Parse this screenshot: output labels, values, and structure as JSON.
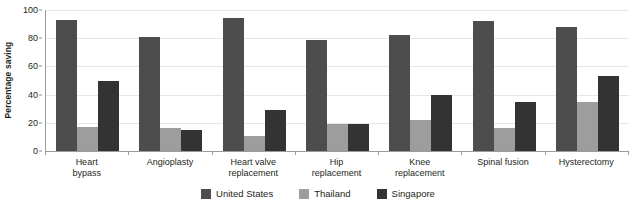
{
  "chart_data": {
    "type": "bar",
    "title": "",
    "xlabel": "",
    "ylabel": "Percentage saving",
    "ylim": [
      0,
      100
    ],
    "yticks": [
      0,
      20,
      40,
      60,
      80,
      100
    ],
    "grid": true,
    "legend_position": "bottom-center",
    "categories": [
      "Heart bypass",
      "Angioplasty",
      "Heart valve replacement",
      "Hip replacement",
      "Knee replacement",
      "Spinal fusion",
      "Hysterectomy"
    ],
    "category_lines": [
      {
        "line1": "Heart",
        "line2": "bypass"
      },
      {
        "line1": "Angioplasty",
        "line2": ""
      },
      {
        "line1": "Heart valve",
        "line2": "replacement"
      },
      {
        "line1": "Hip",
        "line2": "replacement"
      },
      {
        "line1": "Knee",
        "line2": "replacement"
      },
      {
        "line1": "Spinal fusion",
        "line2": ""
      },
      {
        "line1": "Hysterectomy",
        "line2": ""
      }
    ],
    "series": [
      {
        "name": "United States",
        "color": "#4d4d4d",
        "values": [
          93,
          81,
          94,
          79,
          82,
          92,
          88
        ]
      },
      {
        "name": "Thailand",
        "color": "#9d9d9d",
        "values": [
          17,
          16,
          11,
          19,
          22,
          16,
          35
        ]
      },
      {
        "name": "Singapore",
        "color": "#333333",
        "values": [
          50,
          15,
          29,
          19,
          40,
          35,
          53
        ]
      }
    ]
  },
  "axis": {
    "y_title": "Percentage saving",
    "y_tick_labels": [
      "100",
      "80",
      "60",
      "40",
      "20",
      "0"
    ]
  },
  "legend": {
    "items": [
      {
        "label": "United States"
      },
      {
        "label": "Thailand"
      },
      {
        "label": "Singapore"
      }
    ]
  }
}
